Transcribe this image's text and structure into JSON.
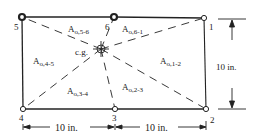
{
  "diagram": {
    "type": "bolt-group-area-decomposition",
    "colors": {
      "stroke": "#222222",
      "background": "#ffffff"
    },
    "nodes": [
      {
        "id": "1",
        "label": "1",
        "x": 204,
        "y": 18,
        "style": "open"
      },
      {
        "id": "2",
        "label": "2",
        "x": 206,
        "y": 109,
        "style": "open"
      },
      {
        "id": "3",
        "label": "3",
        "x": 115,
        "y": 109,
        "style": "open"
      },
      {
        "id": "4",
        "label": "4",
        "x": 23,
        "y": 109,
        "style": "open"
      },
      {
        "id": "5",
        "label": "5",
        "x": 22,
        "y": 17,
        "style": "bold"
      },
      {
        "id": "6",
        "label": "6",
        "x": 114,
        "y": 17,
        "style": "bold"
      }
    ],
    "centroid": {
      "label": "c.g.",
      "x": 101,
      "y": 49
    },
    "areas": [
      {
        "main": "A",
        "sub": "o,5-6"
      },
      {
        "main": "A",
        "sub": "o,6-1"
      },
      {
        "main": "A",
        "sub": "o,1-2"
      },
      {
        "main": "A",
        "sub": "o,2-3"
      },
      {
        "main": "A",
        "sub": "o,3-4"
      },
      {
        "main": "A",
        "sub": "o,4-5"
      }
    ],
    "dimensions": {
      "height": "10 in.",
      "left_width": "10 in.",
      "right_width": "10 in."
    }
  }
}
